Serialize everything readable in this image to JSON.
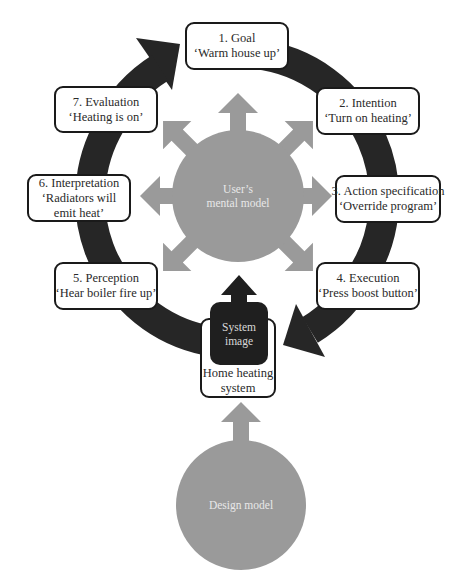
{
  "colors": {
    "cycle_ring": "#262626",
    "mental_model_fill": "#9a9a9a",
    "design_model_fill": "#9a9a9a",
    "system_image_fill": "#1f1f1f",
    "box_border": "#1a1a1a"
  },
  "stages": [
    {
      "title": "1. Goal",
      "example": "‘Warm house up’"
    },
    {
      "title": "2. Intention",
      "example": "‘Turn on heating’"
    },
    {
      "title": "3. Action specification",
      "example": "‘Override program’"
    },
    {
      "title": "4. Execution",
      "example": "‘Press boost button’"
    },
    {
      "title": "5. Perception",
      "example": "‘Hear boiler fire up’"
    },
    {
      "title": "6. Interpretation",
      "example": "‘Radiators will",
      "example2": "emit heat’"
    },
    {
      "title": "7. Evaluation",
      "example": "‘Heating is on’"
    }
  ],
  "mental_model": {
    "line1": "User’s",
    "line2": "mental model"
  },
  "system": {
    "image_line1": "System",
    "image_line2": "image",
    "label_line1": "Home heating",
    "label_line2": "system"
  },
  "design_model": {
    "label": "Design model"
  }
}
